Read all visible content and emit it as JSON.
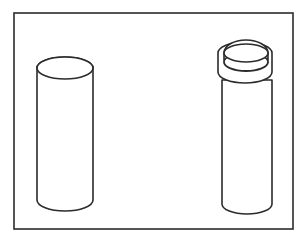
{
  "document": {
    "title": "Two Cylinders Line Drawing",
    "type": "technical-line-drawing",
    "background_color": "#ffffff",
    "stroke_color": "#2b2b2b",
    "fill_color": "#ffffff"
  },
  "canvas": {
    "width": 308,
    "height": 241
  },
  "frame": {
    "label": "border-frame",
    "x": 14,
    "y": 13,
    "width": 279,
    "height": 216,
    "stroke_width": 1.6
  },
  "objects": [
    {
      "id": "left-cylinder",
      "label": "Plain cylinder",
      "has_cap": false,
      "body": {
        "left": 37,
        "right": 93,
        "top_center_y": 68,
        "bottom_center_y": 200,
        "ellipse_rx": 28,
        "ellipse_ry": 11
      },
      "stroke_width": 1.6
    },
    {
      "id": "right-cylinder",
      "label": "Capped cylinder",
      "has_cap": true,
      "body": {
        "left": 222,
        "right": 272,
        "top_center_y": 80,
        "bottom_center_y": 204,
        "ellipse_rx": 25,
        "ellipse_ry": 10
      },
      "cap": {
        "top_left": 224,
        "top_right": 268,
        "top_center_y": 53,
        "top_rx": 22,
        "top_ry": 9,
        "rim_center_y": 72,
        "rim_rx": 27,
        "rim_ry": 11,
        "rim_left": 218,
        "rim_right": 272
      },
      "stroke_width": 1.6
    }
  ],
  "chart_data": {
    "type": "diagram",
    "element_count": 2,
    "elements": [
      {
        "name": "left-cylinder",
        "position": "left",
        "capped": "no",
        "approx_height_px": 143,
        "approx_width_px": 56
      },
      {
        "name": "right-cylinder",
        "position": "right",
        "capped": "yes",
        "approx_height_px": 160,
        "approx_width_px": 54
      }
    ]
  }
}
